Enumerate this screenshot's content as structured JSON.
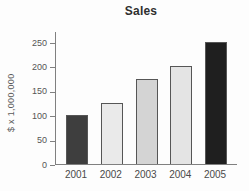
{
  "chart_data": {
    "type": "bar",
    "title": "Sales",
    "categories": [
      "2001",
      "2002",
      "2003",
      "2004",
      "2005"
    ],
    "values": [
      100,
      125,
      175,
      200,
      250
    ],
    "xlabel": "",
    "ylabel": "$ x 1,000,000",
    "yticks": [
      0,
      50,
      100,
      150,
      200,
      250
    ],
    "ylim": [
      0,
      250
    ],
    "grid": false,
    "legend": "none",
    "bar_colors": [
      "#3e3e3e",
      "#eaeaea",
      "#d4d4d4",
      "#e4e4e4",
      "#1f1f1f"
    ],
    "bar_border_color": "#565656",
    "axis_color": "#808080",
    "tick_text_color": "#555555",
    "title_color": "#2f2f2f",
    "background_color": "#fdfdfd"
  }
}
